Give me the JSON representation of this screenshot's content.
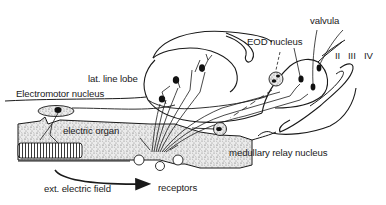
{
  "diagram": {
    "labels": {
      "valvula": "valvula",
      "eod_nucleus": "EOD nucleus",
      "lat_line_lobe": "lat. line lobe",
      "electromotor_nucleus": "Electromotor nucleus",
      "roman_ii": "II",
      "roman_iii": "III",
      "roman_iv": "IV",
      "electric_organ": "electric organ",
      "medullary_relay_nucleus": "medullary relay nucleus",
      "ext_electric_field": "ext. electric field",
      "receptors": "receptors"
    },
    "colors": {
      "ink": "#1a1a1a",
      "stipple_bg": "#e6e6e6",
      "paper": "#ffffff"
    }
  }
}
